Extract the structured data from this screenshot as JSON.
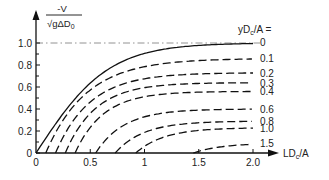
{
  "chart_data": {
    "type": "line",
    "title": "",
    "ylabel_num": "-V",
    "ylabel_den": "√gΔD₀",
    "xlabel": "LDc/A",
    "legend_title": "yDc/A =",
    "xlim": [
      0,
      2.0
    ],
    "ylim": [
      0,
      1.0
    ],
    "xticks": [
      "0",
      "0.5",
      "1",
      "1.5",
      "2.0"
    ],
    "yticks": [
      "0",
      "0.2",
      "0.4",
      "0.6",
      "0.8",
      "1.0"
    ],
    "grid": false,
    "reference_line": {
      "y": 1.0,
      "style": "dash-dot"
    },
    "series": [
      {
        "name": "0",
        "start": 0.0,
        "limit": 1.0,
        "style": "solid",
        "x": [
          0,
          0.25,
          0.5,
          0.75,
          1.0,
          1.25,
          1.5,
          2.0
        ],
        "y": [
          0,
          0.35,
          0.62,
          0.8,
          0.9,
          0.95,
          0.98,
          1.0
        ]
      },
      {
        "name": "0.1",
        "start": 0.09,
        "limit": 0.86,
        "style": "dashed",
        "x": [
          0.09,
          0.5,
          1.0,
          1.5,
          2.0
        ],
        "y": [
          0,
          0.5,
          0.74,
          0.83,
          0.86
        ]
      },
      {
        "name": "0.2",
        "start": 0.18,
        "limit": 0.73,
        "style": "dashed",
        "x": [
          0.18,
          0.5,
          1.0,
          1.5,
          2.0
        ],
        "y": [
          0,
          0.38,
          0.6,
          0.69,
          0.73
        ]
      },
      {
        "name": "0.3",
        "start": 0.27,
        "limit": 0.64,
        "style": "dashed",
        "x": [
          0.27,
          0.5,
          1.0,
          1.5,
          2.0
        ],
        "y": [
          0,
          0.28,
          0.5,
          0.6,
          0.64
        ]
      },
      {
        "name": "0.4",
        "start": 0.36,
        "limit": 0.56,
        "style": "dashed",
        "x": [
          0.36,
          0.5,
          1.0,
          1.5,
          2.0
        ],
        "y": [
          0,
          0.18,
          0.41,
          0.52,
          0.56
        ]
      },
      {
        "name": "0.6",
        "start": 0.55,
        "limit": 0.4,
        "style": "dashed",
        "x": [
          0.55,
          1.0,
          1.5,
          2.0
        ],
        "y": [
          0,
          0.27,
          0.37,
          0.4
        ]
      },
      {
        "name": "0.8",
        "start": 0.73,
        "limit": 0.29,
        "style": "dashed",
        "x": [
          0.73,
          1.0,
          1.5,
          2.0
        ],
        "y": [
          0,
          0.15,
          0.25,
          0.29
        ]
      },
      {
        "name": "1.0",
        "start": 0.92,
        "limit": 0.23,
        "style": "dashed",
        "x": [
          0.92,
          1.5,
          2.0
        ],
        "y": [
          0,
          0.18,
          0.23
        ]
      },
      {
        "name": "1.5",
        "start": 1.45,
        "limit": 0.09,
        "style": "dashed",
        "x": [
          1.45,
          2.0
        ],
        "y": [
          0,
          0.09
        ]
      }
    ]
  }
}
